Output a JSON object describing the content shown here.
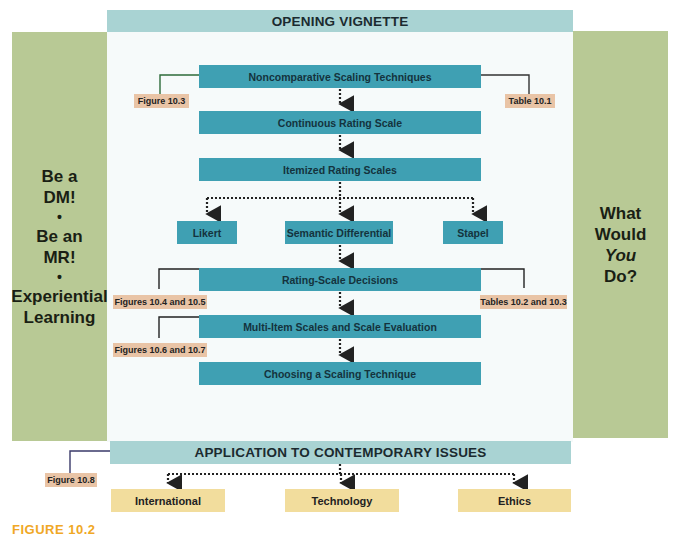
{
  "caption": "FIGURE 10.2",
  "top_banner": "OPENING VIGNETTE",
  "bottom_banner": "APPLICATION TO CONTEMPORARY ISSUES",
  "left_panel": {
    "lines": [
      "Be a",
      "DM!",
      "•",
      "Be an",
      "MR!",
      "•",
      "Experiential",
      "Learning"
    ]
  },
  "right_panel": {
    "line1": "What",
    "line2": "Would",
    "line3_italic": "You",
    "line4": "Do?"
  },
  "flow": {
    "noncomparative": "Noncomparative Scaling Techniques",
    "continuous": "Continuous Rating Scale",
    "itemized": "Itemized Rating Scales",
    "likert": "Likert",
    "semantic": "Semantic Differential",
    "stapel": "Stapel",
    "decisions": "Rating-Scale Decisions",
    "multi_item": "Multi-Item Scales and Scale Evaluation",
    "choosing": "Choosing a Scaling Technique"
  },
  "references": {
    "fig_10_3": "Figure 10.3",
    "table_10_1": "Table 10.1",
    "figs_10_4_10_5": "Figures 10.4 and 10.5",
    "tables_10_2_10_3": "Tables 10.2 and 10.3",
    "figs_10_6_10_7": "Figures 10.6 and 10.7",
    "fig_10_8": "Figure 10.8"
  },
  "issues": [
    "International",
    "Technology",
    "Ethics"
  ],
  "colors": {
    "banner": "#a9d3d3",
    "side_panel": "#b8c995",
    "flow_box": "#3fa0b3",
    "reference": "#e9c4a6",
    "issue_box": "#f2dd9d",
    "caption": "#f0a825"
  }
}
